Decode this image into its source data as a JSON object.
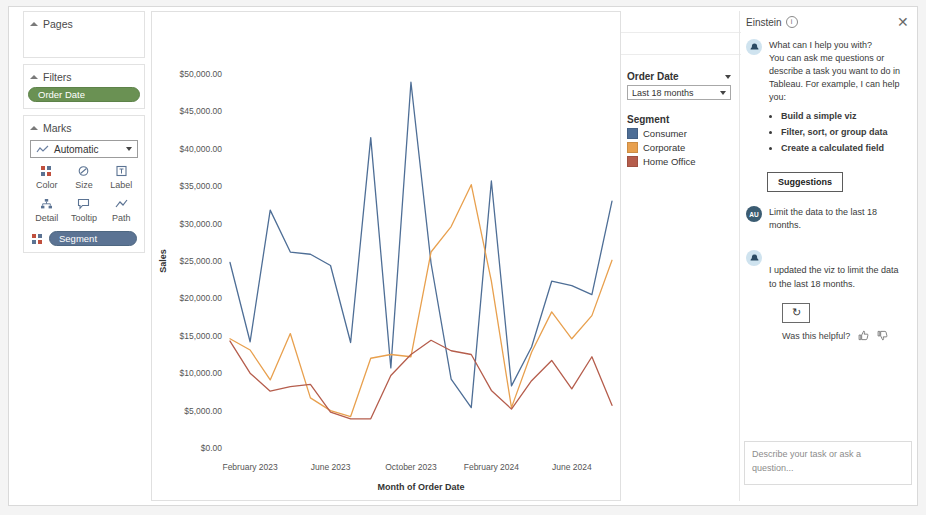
{
  "sidebar": {
    "pages": {
      "label": "Pages"
    },
    "filters": {
      "label": "Filters",
      "pill": "Order Date"
    },
    "marks": {
      "label": "Marks",
      "mark_type": "Automatic",
      "buttons": [
        {
          "label": "Color",
          "icon": "color-icon"
        },
        {
          "label": "Size",
          "icon": "size-icon"
        },
        {
          "label": "Label",
          "icon": "label-icon"
        },
        {
          "label": "Detail",
          "icon": "detail-icon"
        },
        {
          "label": "Tooltip",
          "icon": "tooltip-icon"
        },
        {
          "label": "Path",
          "icon": "path-icon"
        }
      ],
      "encoding_pill": "Segment"
    }
  },
  "shelves": {
    "columns_label": "Columns",
    "columns_pill": "MONTH(Order Date)",
    "rows_label": "Rows",
    "rows_pill": "SUM(Sales)"
  },
  "filter_card": {
    "title": "Order Date",
    "value": "Last 18 months"
  },
  "legend": {
    "title": "Segment",
    "items": [
      {
        "label": "Consumer",
        "color": "#4e6e96"
      },
      {
        "label": "Corporate",
        "color": "#e8a councils"
      },
      {
        "label": "Home Office",
        "color": "#b55d4c"
      }
    ]
  },
  "einstein": {
    "title": "Einstein",
    "close_label": "✕",
    "greeting_line1": "What can I help you with?",
    "greeting_line2": "You can ask me questions or describe a task you want to do in Tableau. For example, I can help you:",
    "bullets": [
      "Build a simple viz",
      "Filter, sort, or group data",
      "Create a calculated field"
    ],
    "suggestions_button": "Suggestions",
    "user_avatar": "AU",
    "user_message": "Limit the data to the last 18 months.",
    "assistant_message": "I updated the viz to limit the data to the last 18 months.",
    "retry_icon": "↻",
    "feedback_label": "Was this helpful?",
    "thumb_up": "👍",
    "thumb_down": "👎",
    "input_placeholder": "Describe your task or ask a question..."
  },
  "chart_data": {
    "type": "line",
    "title": "",
    "xlabel": "Month of Order Date",
    "ylabel": "Sales",
    "ylim": [
      0,
      50000
    ],
    "grid": false,
    "legend_position": "right",
    "ytick_labels": [
      "$50,000.00",
      "$45,000.00",
      "$40,000.00",
      "$35,000.00",
      "$30,000.00",
      "$25,000.00",
      "$20,000.00",
      "$15,000.00",
      "$10,000.00",
      "$5,000.00",
      "$0.00"
    ],
    "ytick_values": [
      50000,
      45000,
      40000,
      35000,
      30000,
      25000,
      20000,
      15000,
      10000,
      5000,
      0
    ],
    "xtick_labels": [
      "February 2023",
      "June 2023",
      "October 2023",
      "February 2024",
      "June 2024"
    ],
    "xtick_index": [
      1,
      5,
      9,
      13,
      17
    ],
    "x": [
      "January 2023",
      "February 2023",
      "March 2023",
      "April 2023",
      "May 2023",
      "June 2023",
      "July 2023",
      "August 2023",
      "September 2023",
      "October 2023",
      "November 2023",
      "December 2023",
      "January 2024",
      "February 2024",
      "March 2024",
      "April 2024",
      "May 2024",
      "June 2024",
      "July 2024",
      "August 2024"
    ],
    "series": [
      {
        "name": "Consumer",
        "color": "#4e6e96",
        "values": [
          24800,
          14200,
          31800,
          26200,
          25900,
          24400,
          14100,
          41500,
          10700,
          48900,
          24700,
          9200,
          5400,
          35700,
          8300,
          13500,
          22300,
          21700,
          20500,
          33000
        ]
      },
      {
        "name": "Corporate",
        "color": "#e8a04e",
        "values": [
          14600,
          13100,
          9100,
          15300,
          6700,
          5000,
          4200,
          12000,
          12500,
          12200,
          26200,
          29600,
          35200,
          22300,
          5400,
          12800,
          18200,
          14600,
          17700,
          25100
        ]
      },
      {
        "name": "Home Office",
        "color": "#b55d4c",
        "values": [
          14300,
          10000,
          7600,
          8200,
          8500,
          4800,
          3900,
          3900,
          9700,
          12500,
          14400,
          13000,
          12500,
          7700,
          5200,
          9000,
          11700,
          7900,
          12200,
          5700
        ]
      }
    ]
  }
}
